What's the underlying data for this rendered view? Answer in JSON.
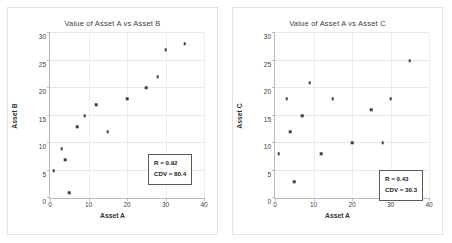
{
  "chart_data": [
    {
      "type": "scatter",
      "title": "Value of Asset A vs Asset B",
      "xlabel": "Asset A",
      "ylabel": "Asset B",
      "xlim": [
        0,
        40
      ],
      "ylim": [
        0,
        30
      ],
      "xticks": [
        0,
        10,
        20,
        30,
        40
      ],
      "yticks": [
        0,
        5,
        10,
        15,
        20,
        25,
        30
      ],
      "grid": true,
      "legend": "none",
      "marker_color": "#3f3f3f",
      "x": [
        1,
        3,
        4,
        5,
        7,
        9,
        12,
        15,
        20,
        25,
        28,
        30,
        35
      ],
      "y": [
        5,
        9,
        7,
        1,
        13,
        15,
        17,
        12,
        18,
        20,
        22,
        27,
        28
      ],
      "annotations": {
        "r_label": "R = 0.92",
        "cdv_label": "CDV = 80.4"
      }
    },
    {
      "type": "scatter",
      "title": "Value of Asset A vs Asset C",
      "xlabel": "Asset A",
      "ylabel": "Asset C",
      "xlim": [
        0,
        40
      ],
      "ylim": [
        0,
        30
      ],
      "xticks": [
        0,
        10,
        20,
        30,
        40
      ],
      "yticks": [
        0,
        5,
        10,
        15,
        20,
        25,
        30
      ],
      "grid": true,
      "legend": "none",
      "marker_color": "#3f3f3f",
      "x": [
        1,
        3,
        4,
        5,
        7,
        9,
        12,
        15,
        20,
        25,
        28,
        30,
        35
      ],
      "y": [
        8,
        18,
        12,
        3,
        15,
        21,
        8,
        18,
        10,
        16,
        10,
        18,
        25
      ],
      "annotations": {
        "r_label": "R = 0.43",
        "cdv_label": "CDV = 30.3"
      }
    }
  ]
}
